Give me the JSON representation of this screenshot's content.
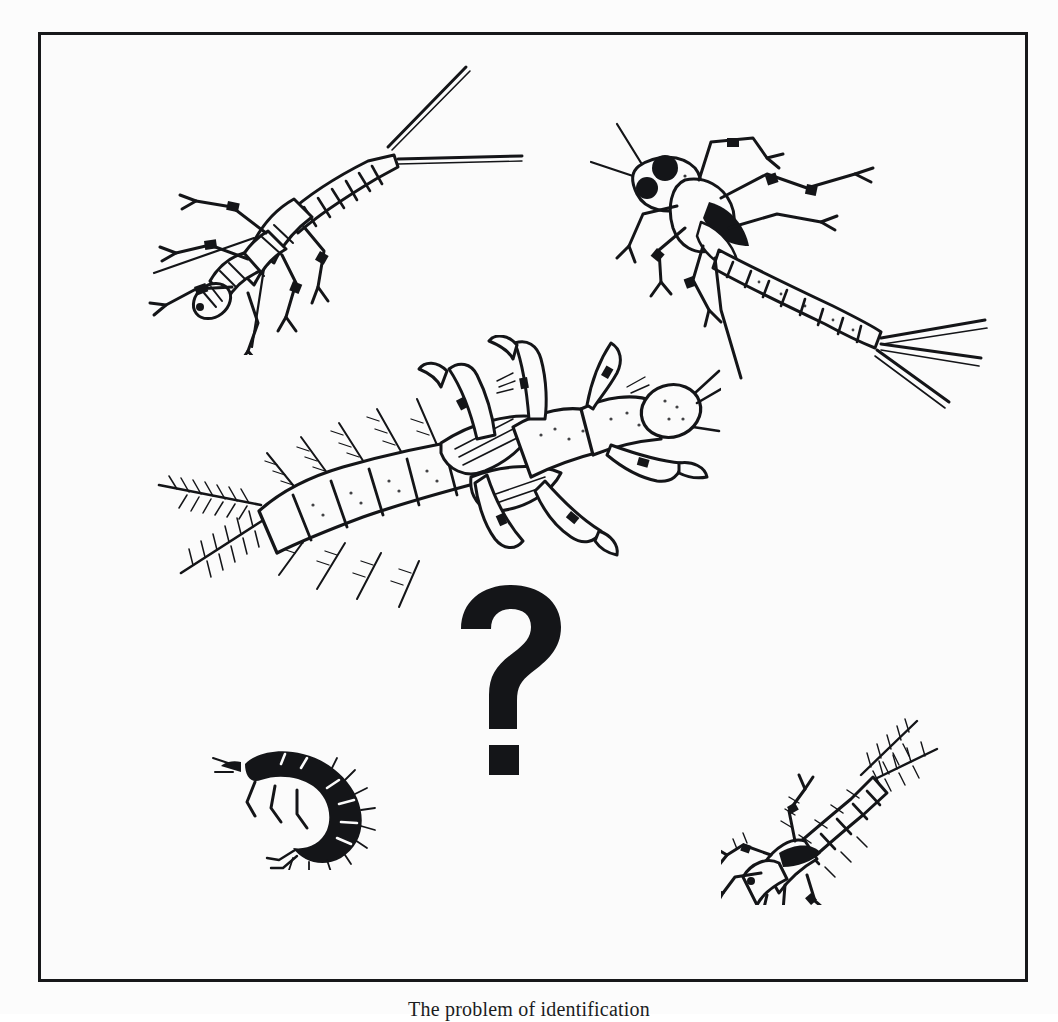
{
  "figure": {
    "caption": "The problem of identification",
    "frame": {
      "border_color": "#17181a",
      "background_color": "#fbfbfb"
    },
    "ink_color": "#141518",
    "page_background": "#fcfcfc",
    "question_mark": {
      "glyph": "?",
      "name": "question-mark-overlay",
      "color": "#141518"
    },
    "specimens": [
      {
        "id": "stonefly",
        "name": "stonefly-nymph-illustration",
        "label": "Stonefly nymph (Plecoptera)",
        "position": "top-left",
        "tails": 2,
        "style": "pen-and-ink line drawing"
      },
      {
        "id": "mayfly",
        "name": "mayfly-nymph-illustration",
        "label": "Mayfly nymph (Ephemeroptera)",
        "position": "top-right",
        "tails": 3,
        "style": "pen-and-ink line drawing"
      },
      {
        "id": "hellgrammite",
        "name": "dobsonfly-larva-illustration",
        "label": "Dobsonfly larva / hellgrammite (Megaloptera)",
        "position": "center",
        "tails": 2,
        "style": "pen-and-ink line drawing with lateral gill filaments"
      },
      {
        "id": "small-larva",
        "name": "small-curled-larva-illustration",
        "label": "Small curled aquatic larva",
        "position": "bottom-left",
        "tails": 0,
        "style": "solid black silhouette"
      },
      {
        "id": "small-nymph",
        "name": "small-nymph-illustration",
        "label": "Small nymph with feathered cerci",
        "position": "bottom-right",
        "tails": 2,
        "style": "pen-and-ink line drawing"
      }
    ]
  }
}
